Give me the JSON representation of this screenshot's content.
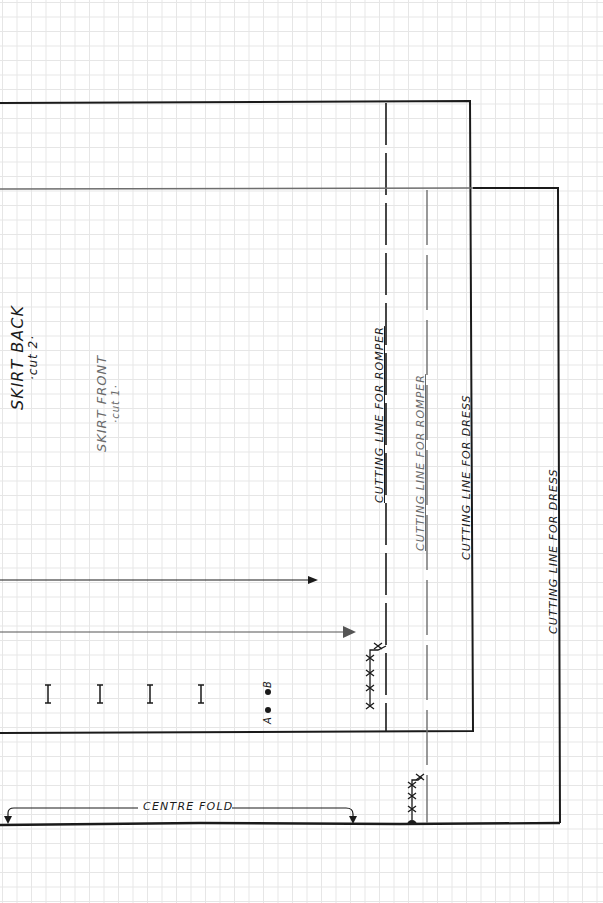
{
  "diagram": {
    "type": "sewing-pattern",
    "background": "graph-paper",
    "colors": {
      "ink_dark": "#1a1a1a",
      "ink_grey": "#6e6e6e",
      "grid": "#e6e6e6",
      "paper": "#ffffff"
    },
    "pieces": [
      {
        "name": "Skirt Back",
        "label": "SKIRT BACK",
        "cut": "·cut 2·"
      },
      {
        "name": "Skirt Front",
        "label": "SKIRT FRONT",
        "cut": "·cut 1·"
      }
    ],
    "cutting_lines": [
      {
        "label": "CUTTING LINE FOR ROMPER",
        "piece": "Skirt Back",
        "style": "dashed"
      },
      {
        "label": "CUTTING LINE FOR ROMPER",
        "piece": "Skirt Front",
        "style": "dashed"
      },
      {
        "label": "CUTTING LINE FOR DRESS",
        "piece": "Skirt Back",
        "style": "solid"
      },
      {
        "label": "CUTTING LINE FOR DRESS",
        "piece": "Skirt Front",
        "style": "solid"
      }
    ],
    "centre_fold": {
      "label": "CENTRE FOLD"
    },
    "notches": {
      "count": 4,
      "glyph": "I"
    },
    "markers": [
      {
        "label": "A"
      },
      {
        "label": "B"
      }
    ]
  }
}
